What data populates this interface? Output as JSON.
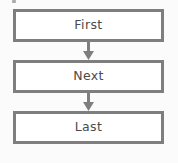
{
  "diagram": {
    "background_color": "#fbfbfb",
    "node_border_color": "#7e7e7e",
    "node_fill_color": "#ffffff",
    "text_color": "#4a4a4a",
    "arrow_color": "#7e7e7e",
    "nodes": [
      {
        "id": "first",
        "label": "First",
        "shape": "rectangle"
      },
      {
        "id": "next",
        "label": "Next",
        "shape": "rectangle"
      },
      {
        "id": "last",
        "label": "Last",
        "shape": "rectangle"
      }
    ],
    "connectors": [
      {
        "id": "first-to-next",
        "from": "First",
        "to": "Next",
        "style": "arrow-down"
      },
      {
        "id": "next-to-last",
        "from": "Next",
        "to": "Last",
        "style": "arrow-down"
      }
    ]
  }
}
